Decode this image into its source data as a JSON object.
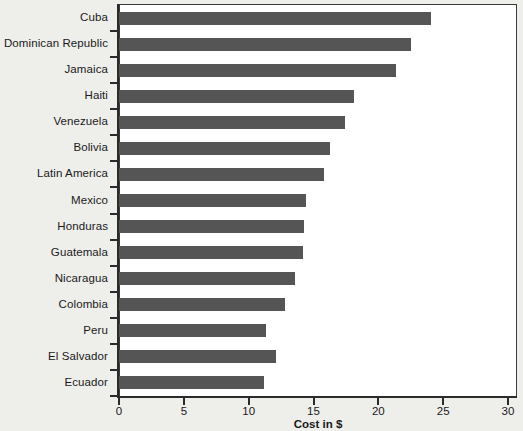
{
  "chart_data": {
    "type": "bar",
    "orientation": "horizontal",
    "title": "",
    "xlabel": "Cost in $",
    "ylabel": "",
    "xlim": [
      0,
      30
    ],
    "xticks": [
      0,
      5,
      10,
      15,
      20,
      25,
      30
    ],
    "xtick_labels": [
      "0",
      "5",
      "10",
      "15",
      "20",
      "25",
      "30"
    ],
    "grid": false,
    "legend": null,
    "bar_color": "#555555",
    "plot_background": "#ffffff",
    "figure_background": "#eeeeea",
    "axis_color": "#2b2b2b",
    "categories": [
      "Cuba",
      "Dominican Republic",
      "Jamaica",
      "Haiti",
      "Venezuela",
      "Bolivia",
      "Latin America",
      "Mexico",
      "Honduras",
      "Guatemala",
      "Nicaragua",
      "Colombia",
      "Peru",
      "El Salvador",
      "Ecuador"
    ],
    "values": [
      24.1,
      22.5,
      21.4,
      18.1,
      17.4,
      16.3,
      15.8,
      14.4,
      14.3,
      14.2,
      13.6,
      12.8,
      11.3,
      12.1,
      11.2
    ]
  }
}
